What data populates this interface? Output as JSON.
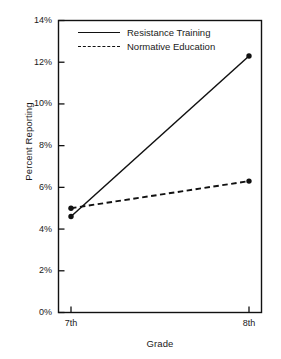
{
  "chart_data": {
    "type": "line",
    "title": "",
    "xlabel": "Grade",
    "ylabel": "Percent Reporting",
    "categories": [
      "7th",
      "8th"
    ],
    "x": [
      0,
      1
    ],
    "ylim": [
      0,
      14
    ],
    "yticks": [
      0,
      2,
      4,
      6,
      8,
      10,
      12,
      14
    ],
    "ytick_labels": [
      "0%",
      "2%",
      "4%",
      "6%",
      "8%",
      "10%",
      "12%",
      "14%"
    ],
    "xtick_labels": [
      "7th",
      "8th"
    ],
    "grid": false,
    "legend_position": "upper left inside",
    "series": [
      {
        "name": "Resistance Training",
        "style": "solid",
        "marker": "filled-circle",
        "color": "#111111",
        "values": [
          4.6,
          12.3
        ]
      },
      {
        "name": "Normative Education",
        "style": "dashed",
        "marker": "filled-circle",
        "color": "#111111",
        "values": [
          5.0,
          6.3
        ]
      }
    ]
  },
  "axes": {
    "y_title": "Percent Reporting",
    "x_title": "Grade"
  },
  "legend": {
    "entries": [
      {
        "label": "Resistance Training",
        "style": "solid"
      },
      {
        "label": "Normative Education",
        "style": "dashed"
      }
    ]
  },
  "colors": {
    "ink": "#111111",
    "background": "#ffffff"
  }
}
